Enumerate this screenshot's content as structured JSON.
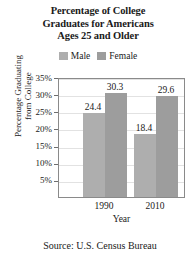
{
  "chart_data": {
    "type": "bar",
    "title": "Percentage of College Graduates for Americans Ages 25 and Older",
    "title_lines": [
      "Percentage of College",
      "Graduates for Americans",
      "Ages 25 and Older"
    ],
    "categories": [
      "1990",
      "2010"
    ],
    "series": [
      {
        "name": "Male",
        "values": [
          24.4,
          18.4
        ],
        "color": "#aeaeae"
      },
      {
        "name": "Female",
        "values": [
          30.3,
          29.6
        ],
        "color": "#9d9d9d"
      }
    ],
    "note": "Bars are grouped by year; within each year the left bar is the first series value and the right bar is the second series value as printed above each bar.",
    "bars": [
      {
        "group": "1990",
        "series": "Male",
        "value": 24.4,
        "label": "24.4"
      },
      {
        "group": "1990",
        "series": "Female",
        "value": 18.4,
        "label": "18.4"
      },
      {
        "group": "2010",
        "series": "Male",
        "value": 30.3,
        "label": "30.3"
      },
      {
        "group": "2010",
        "series": "Female",
        "value": 29.6,
        "label": "29.6"
      }
    ],
    "xlabel": "Year",
    "ylabel": "Percentage Graduating from College",
    "ylabel_lines": [
      "Percentage Graduating",
      "from College"
    ],
    "ylim": [
      0,
      35
    ],
    "ytick_values": [
      35,
      30,
      25,
      20,
      15,
      10,
      5
    ],
    "ytick_labels": [
      "35%",
      "30%",
      "25%",
      "20%",
      "15%",
      "10%",
      "5%"
    ],
    "grid": true,
    "grid_axis": "y",
    "legend": [
      "Male",
      "Female"
    ],
    "legend_position": "top",
    "source": "Source: U.S. Census Bureau"
  },
  "colors": {
    "male": "#aeaeae",
    "female": "#9d9d9d",
    "gridline": "#e2e2e2",
    "axis": "#8a8a8a",
    "text": "#1a1a1a"
  }
}
